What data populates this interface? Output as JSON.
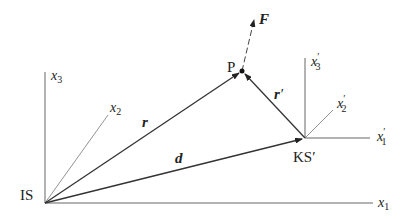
{
  "diagram": {
    "colors": {
      "line": "#333333",
      "thin": "#666666",
      "background": "#ffffff"
    },
    "frames": {
      "IS": {
        "label": "IS",
        "axes": [
          {
            "name": "x1",
            "base": "x",
            "sub": "1"
          },
          {
            "name": "x2",
            "base": "x",
            "sub": "2"
          },
          {
            "name": "x3",
            "base": "x",
            "sub": "3"
          }
        ]
      },
      "KS": {
        "label": "KS′",
        "axes": [
          {
            "name": "x1'",
            "base": "x",
            "sub": "1",
            "prime": "′"
          },
          {
            "name": "x2'",
            "base": "x",
            "sub": "2",
            "prime": "′"
          },
          {
            "name": "x3'",
            "base": "x",
            "sub": "3",
            "prime": "′"
          }
        ]
      }
    },
    "point": {
      "label": "P"
    },
    "vectors": {
      "r": {
        "label": "r"
      },
      "d": {
        "label": "d"
      },
      "r_prime": {
        "label": "r",
        "prime": "′"
      },
      "F": {
        "label": "F"
      }
    }
  }
}
